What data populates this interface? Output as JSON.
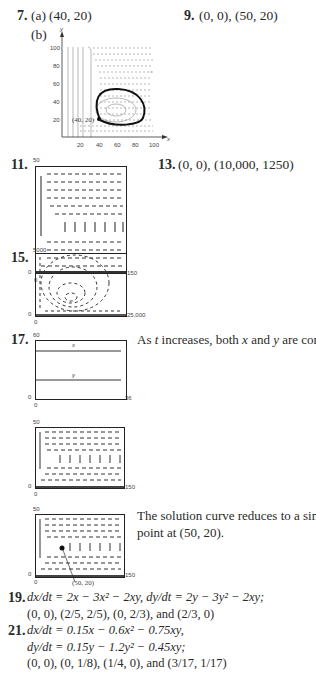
{
  "problems": {
    "p7": {
      "number": "7.",
      "part_a_label": "(a)",
      "part_a": "(40, 20)",
      "part_b_label": "(b)",
      "graph": {
        "y_label": "y",
        "x_label": "x",
        "y_ticks": [
          "100",
          "80",
          "60",
          "40",
          "20"
        ],
        "x_ticks": [
          "20",
          "40",
          "60",
          "80",
          "100"
        ],
        "point_label": "(40, 20)"
      }
    },
    "p9": {
      "number": "9.",
      "answer": "(0, 0), (50, 20)"
    },
    "p11": {
      "number": "11.",
      "y_max": "50",
      "y_min": "0",
      "x_min": "0",
      "x_max": "150"
    },
    "p13": {
      "number": "13.",
      "answer": "(0, 0), (10,000, 1250)"
    },
    "p15": {
      "number": "15.",
      "y_max": "5000",
      "y_min": "0",
      "x_min": "0",
      "x_max": "25,000"
    },
    "p17": {
      "number": "17.",
      "answer": "As t increases, both x and y are constant.",
      "graph1": {
        "y_max": "60",
        "y_min": "0",
        "x_min": "0",
        "x_max": "36",
        "line_x": "x",
        "line_y": "y"
      },
      "graph2": {
        "y_max": "50",
        "y_min": "0",
        "x_min": "0",
        "x_max": "150"
      },
      "graph3": {
        "y_max": "50",
        "y_min": "0",
        "x_min": "0",
        "x_max": "150",
        "point_label": "(50, 20)"
      },
      "answer2_line1": "The solution curve reduces to a single",
      "answer2_line2": "point at (50, 20)."
    },
    "p19": {
      "number": "19.",
      "line1": "dx/dt = 2x − 3x² − 2xy, dy/dt = 2y − 3y² − 2xy;",
      "line2": "(0, 0), (2/5, 2/5), (0, 2/3), and (2/3, 0)"
    },
    "p21": {
      "number": "21.",
      "line1": "dx/dt = 0.15x − 0.6x² − 0.75xy,",
      "line2": "dy/dt = 0.15y − 1.2y² − 0.45xy;",
      "line3": "(0, 0), (0, 1/8), (1/4, 0), and (3/17, 1/17)"
    }
  }
}
